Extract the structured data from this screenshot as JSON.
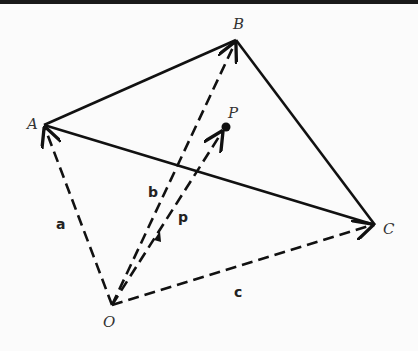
{
  "diagram": {
    "points": {
      "A": {
        "label": "A",
        "x": 44,
        "y": 125
      },
      "B": {
        "label": "B",
        "x": 236,
        "y": 40
      },
      "C": {
        "label": "C",
        "x": 375,
        "y": 225
      },
      "O": {
        "label": "O",
        "x": 112,
        "y": 305
      },
      "P": {
        "label": "P",
        "x": 226,
        "y": 127
      }
    },
    "vectors": {
      "a": {
        "label": "a",
        "from": "O",
        "to": "A"
      },
      "b": {
        "label": "b",
        "from": "O",
        "to": "B"
      },
      "c": {
        "label": "c",
        "from": "O",
        "to": "C"
      },
      "p": {
        "label": "p",
        "from": "O",
        "to": "P"
      }
    },
    "edges": [
      [
        "A",
        "B"
      ],
      [
        "B",
        "C"
      ],
      [
        "A",
        "C"
      ]
    ],
    "colors": {
      "line": "#111111",
      "background": "#fbfbfb"
    }
  }
}
